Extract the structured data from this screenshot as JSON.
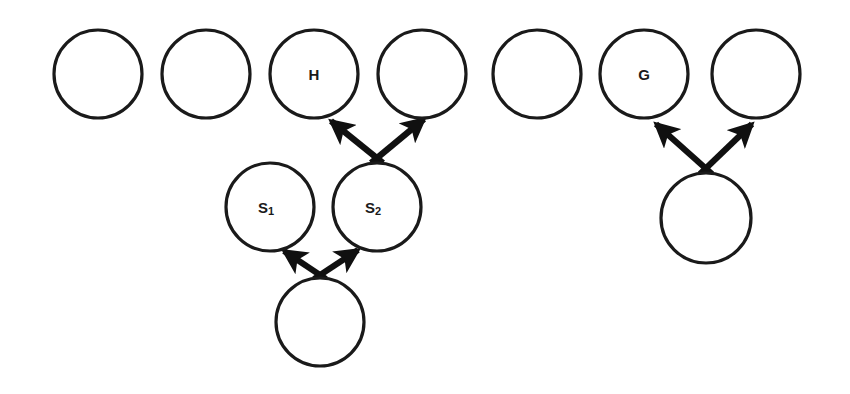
{
  "figure": {
    "background_color": "#ffffff",
    "stroke_color": "#1a1a1a",
    "arrow_color": "#101010",
    "width": 850,
    "height": 394
  },
  "nodes": {
    "top_row": [
      {
        "id": "t1",
        "label": "",
        "cx": 98,
        "cy": 74,
        "r": 44
      },
      {
        "id": "t2",
        "label": "",
        "cx": 206,
        "cy": 74,
        "r": 44
      },
      {
        "id": "t3",
        "label": "H",
        "cx": 314,
        "cy": 74,
        "r": 44
      },
      {
        "id": "t4",
        "label": "",
        "cx": 422,
        "cy": 74,
        "r": 44
      },
      {
        "id": "t5",
        "label": "",
        "cx": 537,
        "cy": 74,
        "r": 44
      },
      {
        "id": "t6",
        "label": "G",
        "cx": 644,
        "cy": 74,
        "r": 44
      },
      {
        "id": "t7",
        "label": "",
        "cx": 756,
        "cy": 74,
        "r": 44
      }
    ],
    "middle_row": [
      {
        "id": "m1",
        "label": "S",
        "sub": "1",
        "cx": 270,
        "cy": 207,
        "r": 44
      },
      {
        "id": "m2",
        "label": "S",
        "sub": "2",
        "cx": 377,
        "cy": 207,
        "r": 44
      },
      {
        "id": "m3",
        "label": "",
        "sub": "",
        "cx": 706,
        "cy": 218,
        "r": 45
      }
    ],
    "bottom_row": [
      {
        "id": "b1",
        "label": "",
        "cx": 320,
        "cy": 322,
        "r": 44
      }
    ]
  },
  "arrows": [
    {
      "id": "a1",
      "from": "m2",
      "to": "t3",
      "x1": 383,
      "y1": 163,
      "x2": 331,
      "y2": 121
    },
    {
      "id": "a2",
      "from": "m2",
      "to": "t4",
      "x1": 371,
      "y1": 163,
      "x2": 424,
      "y2": 119
    },
    {
      "id": "a3",
      "from": "b1",
      "to": "m1",
      "x1": 326,
      "y1": 279,
      "x2": 284,
      "y2": 251
    },
    {
      "id": "a4",
      "from": "b1",
      "to": "m2",
      "x1": 314,
      "y1": 279,
      "x2": 358,
      "y2": 250
    },
    {
      "id": "a5",
      "from": "m3",
      "to": "t6",
      "x1": 712,
      "y1": 174,
      "x2": 656,
      "y2": 124
    },
    {
      "id": "a6",
      "from": "m3",
      "to": "t7",
      "x1": 700,
      "y1": 174,
      "x2": 752,
      "y2": 124
    }
  ],
  "labels": {
    "h_node": "H",
    "g_node": "G",
    "s1_base": "S",
    "s1_sub": "1",
    "s2_base": "S",
    "s2_sub": "2"
  }
}
